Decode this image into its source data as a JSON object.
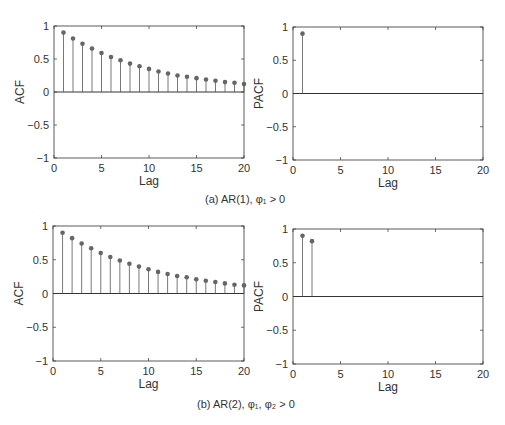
{
  "chart_data": [
    {
      "id": "a_acf",
      "type": "stem",
      "title": "",
      "xlabel": "Lag",
      "ylabel": "ACF",
      "xlim": [
        0,
        20
      ],
      "ylim": [
        -1,
        1
      ],
      "xticks": [
        0,
        5,
        10,
        15,
        20
      ],
      "yticks": [
        -1,
        -0.5,
        0,
        0.5,
        1
      ],
      "x": [
        1,
        2,
        3,
        4,
        5,
        6,
        7,
        8,
        9,
        10,
        11,
        12,
        13,
        14,
        15,
        16,
        17,
        18,
        19,
        20
      ],
      "values": [
        0.9,
        0.81,
        0.73,
        0.66,
        0.59,
        0.53,
        0.48,
        0.43,
        0.39,
        0.35,
        0.31,
        0.28,
        0.25,
        0.23,
        0.21,
        0.19,
        0.17,
        0.15,
        0.14,
        0.12
      ]
    },
    {
      "id": "a_pacf",
      "type": "stem",
      "title": "",
      "xlabel": "Lag",
      "ylabel": "PACF",
      "xlim": [
        0,
        20
      ],
      "ylim": [
        -1,
        1
      ],
      "xticks": [
        0,
        5,
        10,
        15,
        20
      ],
      "yticks": [
        -1,
        -0.5,
        0,
        0.5,
        1
      ],
      "x": [
        1,
        2,
        3,
        4,
        5,
        6,
        7,
        8,
        9,
        10,
        11,
        12,
        13,
        14,
        15,
        16,
        17,
        18,
        19,
        20
      ],
      "values": [
        0.9,
        0,
        0,
        0,
        0,
        0,
        0,
        0,
        0,
        0,
        0,
        0,
        0,
        0,
        0,
        0,
        0,
        0,
        0,
        0
      ]
    },
    {
      "id": "b_acf",
      "type": "stem",
      "title": "",
      "xlabel": "Lag",
      "ylabel": "ACF",
      "xlim": [
        0,
        20
      ],
      "ylim": [
        -1,
        1
      ],
      "xticks": [
        0,
        5,
        10,
        15,
        20
      ],
      "yticks": [
        -1,
        -0.5,
        0,
        0.5,
        1
      ],
      "x": [
        1,
        2,
        3,
        4,
        5,
        6,
        7,
        8,
        9,
        10,
        11,
        12,
        13,
        14,
        15,
        16,
        17,
        18,
        19,
        20
      ],
      "values": [
        0.9,
        0.82,
        0.74,
        0.67,
        0.6,
        0.54,
        0.49,
        0.44,
        0.4,
        0.36,
        0.32,
        0.29,
        0.26,
        0.24,
        0.21,
        0.19,
        0.17,
        0.15,
        0.13,
        0.12
      ]
    },
    {
      "id": "b_pacf",
      "type": "stem",
      "title": "",
      "xlabel": "Lag",
      "ylabel": "PACF",
      "xlim": [
        0,
        20
      ],
      "ylim": [
        -1,
        1
      ],
      "xticks": [
        0,
        5,
        10,
        15,
        20
      ],
      "yticks": [
        -1,
        -0.5,
        0,
        0.5,
        1
      ],
      "x": [
        1,
        2,
        3,
        4,
        5,
        6,
        7,
        8,
        9,
        10,
        11,
        12,
        13,
        14,
        15,
        16,
        17,
        18,
        19,
        20
      ],
      "values": [
        0.9,
        0.82,
        0,
        0,
        0,
        0,
        0,
        0,
        0,
        0,
        0,
        0,
        0,
        0,
        0,
        0,
        0,
        0,
        0,
        0
      ]
    }
  ],
  "captions": {
    "a": "(a) AR(1), φ₁ > 0",
    "b": "(b) AR(2), φ₁, φ₂ > 0"
  },
  "colors": {
    "axis": "#333333",
    "stem": "#555555",
    "marker": "#666666"
  }
}
